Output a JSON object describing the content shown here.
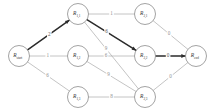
{
  "figure": {
    "kind": "weighted-directed-graph",
    "background_color": "#ffffff",
    "node_stroke_color": "#8c8c8c",
    "node_fill_color": "#ffffff",
    "edge_color_normal": "#b0b0b0",
    "edge_color_highlight": "#2b2b2b",
    "label_color": "#3a3a3a",
    "edge_label_color": "#8f8f8f",
    "edge_label_color_highlight": "#555555"
  },
  "nodes": [
    {
      "id": "start",
      "label": "R",
      "sub": "start",
      "x": 19,
      "y": 56,
      "r": 10.5
    },
    {
      "id": "r11",
      "label": "R",
      "sub": "1,1",
      "x": 78,
      "y": 14,
      "r": 10.5
    },
    {
      "id": "r12",
      "label": "R",
      "sub": "1,2",
      "x": 78,
      "y": 56,
      "r": 10.5
    },
    {
      "id": "r13",
      "label": "R",
      "sub": "1,3",
      "x": 78,
      "y": 97,
      "r": 10.5
    },
    {
      "id": "r21",
      "label": "R",
      "sub": "2,1",
      "x": 145,
      "y": 14,
      "r": 10.5
    },
    {
      "id": "r22",
      "label": "R",
      "sub": "2,2",
      "x": 145,
      "y": 56,
      "r": 10.5
    },
    {
      "id": "r23",
      "label": "R",
      "sub": "2,3",
      "x": 145,
      "y": 97,
      "r": 10.5
    },
    {
      "id": "end",
      "label": "R",
      "sub": "end",
      "x": 196,
      "y": 56,
      "r": 10.5
    }
  ],
  "edges": [
    {
      "id": "e-start-r11",
      "from": "start",
      "to": "r11",
      "weight": "2",
      "highlight": true,
      "label_t": 0.52
    },
    {
      "id": "e-start-r12",
      "from": "start",
      "to": "r12",
      "weight": "1",
      "highlight": false,
      "label_t": 0.48
    },
    {
      "id": "e-start-r13",
      "from": "start",
      "to": "r13",
      "weight": "6",
      "highlight": false,
      "label_t": 0.48
    },
    {
      "id": "e-r11-r21",
      "from": "r11",
      "to": "r21",
      "weight": "1",
      "highlight": false,
      "label_t": 0.5
    },
    {
      "id": "e-r11-r22",
      "from": "r11",
      "to": "r22",
      "weight": "6",
      "highlight": true,
      "label_t": 0.4
    },
    {
      "id": "e-r11-r23",
      "from": "r11",
      "to": "r23",
      "weight": "9",
      "highlight": false,
      "label_t": 0.4
    },
    {
      "id": "e-r12-r22",
      "from": "r12",
      "to": "r22",
      "weight": "6",
      "highlight": false,
      "label_t": 0.38
    },
    {
      "id": "e-r12-r23",
      "from": "r12",
      "to": "r23",
      "weight": "9",
      "highlight": false,
      "label_t": 0.44
    },
    {
      "id": "e-r13-r23",
      "from": "r13",
      "to": "r23",
      "weight": "8",
      "highlight": false,
      "label_t": 0.5
    },
    {
      "id": "e-r21-end",
      "from": "r21",
      "to": "end",
      "weight": "0",
      "highlight": false,
      "label_t": 0.46
    },
    {
      "id": "e-r22-end",
      "from": "r22",
      "to": "end",
      "weight": "0",
      "highlight": true,
      "label_t": 0.42
    },
    {
      "id": "e-r23-end",
      "from": "r23",
      "to": "end",
      "weight": "0",
      "highlight": false,
      "label_t": 0.5
    }
  ],
  "highlighted_path": [
    "start",
    "r11",
    "r22",
    "end"
  ]
}
